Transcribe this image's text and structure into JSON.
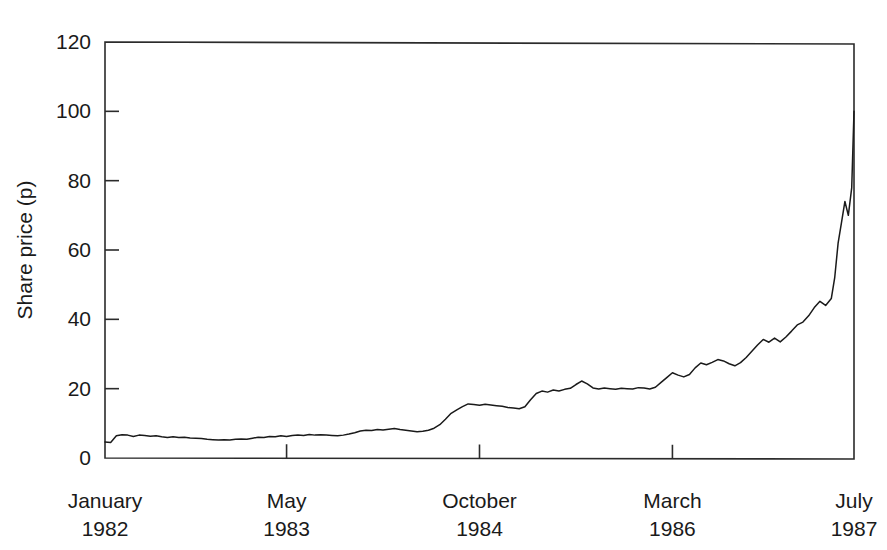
{
  "chart_data": {
    "type": "line",
    "title": "",
    "subtitle": "",
    "xlabel": "",
    "ylabel": "Share price (p)",
    "ylim": [
      0,
      120
    ],
    "yticks": [
      0,
      20,
      40,
      60,
      80,
      100,
      120
    ],
    "ytick_labels": [
      "0",
      "20",
      "40",
      "60",
      "80",
      "100",
      "120"
    ],
    "grid": false,
    "legend": null,
    "x_axis_type": "time",
    "xtick_positions": [
      0,
      16,
      33,
      50,
      66
    ],
    "xtick_labels": [
      {
        "month": "January",
        "year": "1982"
      },
      {
        "month": "May",
        "year": "1983"
      },
      {
        "month": "October",
        "year": "1984"
      },
      {
        "month": "March",
        "year": "1986"
      },
      {
        "month": "July",
        "year": "1987"
      }
    ],
    "xlim_months": [
      0,
      66
    ],
    "series": [
      {
        "name": "Share price",
        "color": "#1a1a1a",
        "x": [
          0,
          0.5,
          1,
          1.5,
          2,
          2.5,
          3,
          3.5,
          4,
          4.5,
          5,
          5.5,
          6,
          6.5,
          7,
          7.5,
          8,
          8.5,
          9,
          9.5,
          10,
          10.5,
          11,
          11.5,
          12,
          12.5,
          13,
          13.5,
          14,
          14.5,
          15,
          15.5,
          16,
          16.5,
          17,
          17.5,
          18,
          18.5,
          19,
          19.5,
          20,
          20.5,
          21,
          21.5,
          22,
          22.5,
          23,
          23.5,
          24,
          24.5,
          25,
          25.5,
          26,
          26.5,
          27,
          27.5,
          28,
          28.5,
          29,
          29.5,
          30,
          30.5,
          31,
          31.5,
          32,
          32.5,
          33,
          33.5,
          34,
          34.5,
          35,
          35.5,
          36,
          36.5,
          37,
          37.5,
          38,
          38.5,
          39,
          39.5,
          40,
          40.5,
          41,
          41.5,
          42,
          42.5,
          43,
          43.5,
          44,
          44.5,
          45,
          45.5,
          46,
          46.5,
          47,
          47.5,
          48,
          48.5,
          49,
          49.5,
          50,
          50.5,
          51,
          51.5,
          52,
          52.5,
          53,
          53.5,
          54,
          54.5,
          55,
          55.5,
          56,
          56.5,
          57,
          57.5,
          58,
          58.5,
          59,
          59.5,
          60,
          60.5,
          61,
          61.5,
          62,
          62.5,
          63,
          63.5,
          64,
          64.3,
          64.6,
          64.9,
          65.2,
          65.5,
          65.8,
          66
        ],
        "y": [
          4.6,
          4.5,
          6.4,
          6.7,
          6.6,
          6.2,
          6.6,
          6.5,
          6.3,
          6.4,
          6.1,
          5.9,
          6.1,
          5.9,
          6.0,
          5.8,
          5.7,
          5.6,
          5.4,
          5.3,
          5.2,
          5.3,
          5.2,
          5.4,
          5.5,
          5.4,
          5.7,
          6.0,
          5.9,
          6.2,
          6.1,
          6.4,
          6.2,
          6.5,
          6.6,
          6.5,
          6.8,
          6.6,
          6.7,
          6.6,
          6.5,
          6.4,
          6.6,
          6.9,
          7.3,
          7.8,
          8.0,
          7.9,
          8.2,
          8.1,
          8.3,
          8.5,
          8.2,
          8.0,
          7.8,
          7.6,
          7.7,
          8.0,
          8.6,
          9.6,
          11.2,
          12.9,
          13.9,
          14.8,
          15.6,
          15.4,
          15.2,
          15.5,
          15.3,
          15.1,
          14.9,
          14.6,
          14.4,
          14.2,
          14.8,
          16.8,
          18.6,
          19.3,
          19.0,
          19.6,
          19.3,
          19.8,
          20.1,
          21.2,
          22.2,
          21.4,
          20.2,
          19.9,
          20.2,
          20.0,
          19.8,
          20.1,
          20.0,
          19.9,
          20.3,
          20.2,
          19.9,
          20.4,
          21.8,
          23.2,
          24.6,
          23.9,
          23.4,
          24.1,
          26.0,
          27.4,
          26.9,
          27.6,
          28.4,
          28.0,
          27.2,
          26.6,
          27.5,
          29.0,
          30.8,
          32.6,
          34.2,
          33.4,
          34.6,
          33.5,
          34.9,
          36.6,
          38.4,
          39.2,
          41.0,
          43.4,
          45.2,
          44.0,
          46.0,
          52.0,
          62.0,
          68.0,
          74.0,
          70.0,
          78.0,
          100.0
        ],
        "annotations": [
          {
            "label": "start",
            "value": 4.6
          },
          {
            "label": "peak",
            "value": 100.0
          }
        ]
      }
    ]
  },
  "axes": {
    "y_title": "Share price (p)",
    "tick_color": "#2b2b2b",
    "frame_color": "#2b2b2b"
  }
}
